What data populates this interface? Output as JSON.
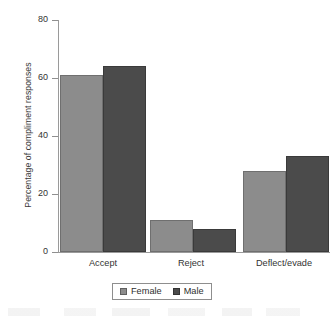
{
  "chart_data": {
    "type": "bar",
    "title": "",
    "xlabel": "",
    "ylabel": "Percentage of compliment responses",
    "categories": [
      "Accept",
      "Reject",
      "Deflect/evade"
    ],
    "series": [
      {
        "name": "Female",
        "color": "#8c8c8c",
        "values": [
          61,
          11,
          28
        ]
      },
      {
        "name": "Male",
        "color": "#4b4b4b",
        "values": [
          64,
          8,
          33
        ]
      }
    ],
    "ylim": [
      0,
      80
    ],
    "yticks": [
      0,
      20,
      40,
      60,
      80
    ],
    "ytick_labels": [
      "0",
      "20",
      "40",
      "60",
      "80"
    ],
    "grid": false,
    "legend_position": "bottom"
  },
  "axes": {
    "y_title": "Percentage of compliment responses",
    "y_labels": {
      "t0": "0",
      "t20": "20",
      "t40": "40",
      "t60": "60",
      "t80": "80"
    },
    "x_labels": {
      "c0": "Accept",
      "c1": "Reject",
      "c2": "Deflect/evade"
    }
  },
  "legend": {
    "items": [
      {
        "label": "Female",
        "color": "#8c8c8c"
      },
      {
        "label": "Male",
        "color": "#4b4b4b"
      }
    ]
  }
}
